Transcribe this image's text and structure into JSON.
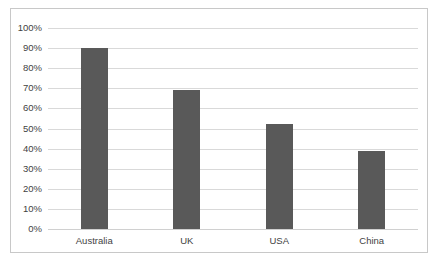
{
  "chart_data": {
    "type": "bar",
    "title": "",
    "subtitle": "",
    "xlabel": "",
    "ylabel": "",
    "categories": [
      "Australia",
      "UK",
      "USA",
      "China"
    ],
    "values": [
      90,
      69,
      52,
      39
    ],
    "value_suffix": "%",
    "ylim": [
      0,
      100
    ],
    "ytick_labels": [
      "0%",
      "10%",
      "20%",
      "30%",
      "40%",
      "50%",
      "60%",
      "70%",
      "80%",
      "90%",
      "100%"
    ],
    "ytick_values": [
      0,
      10,
      20,
      30,
      40,
      50,
      60,
      70,
      80,
      90,
      100
    ],
    "grid": true,
    "grid_axis": "y",
    "legend": false,
    "legend_position": "none",
    "annotations": [],
    "colors": {
      "bar": "#595959",
      "gridline": "#d9d9d9",
      "border": "#c8c8c8",
      "background": "#ffffff",
      "text": "#3f3f3f"
    }
  }
}
